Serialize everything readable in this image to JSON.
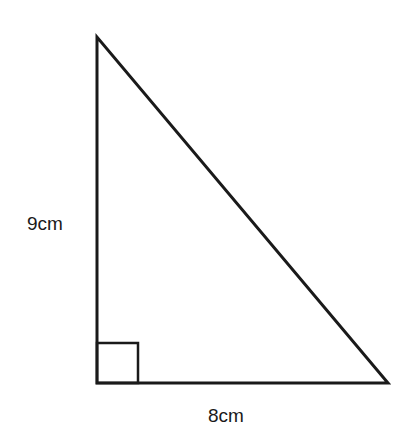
{
  "diagram": {
    "type": "right-triangle",
    "vertices": {
      "top": [
        97,
        37
      ],
      "right_angle": [
        97,
        383
      ],
      "bottom_right": [
        388,
        383
      ]
    },
    "right_angle_marker": {
      "x": 97,
      "y": 343,
      "size": 41
    },
    "labels": {
      "vertical_side": "9cm",
      "horizontal_side": "8cm"
    },
    "stroke_color": "#1a1a1a"
  }
}
